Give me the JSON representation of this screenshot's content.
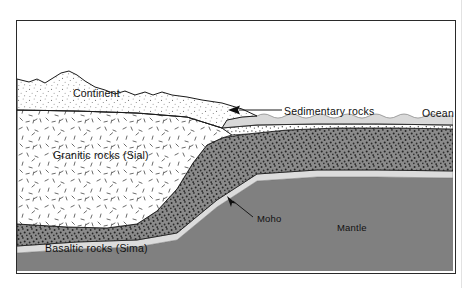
{
  "figure": {
    "kind": "geological-cross-section",
    "frame": {
      "x": 16,
      "y": 20,
      "width": 438,
      "height": 252,
      "border_color": "#2a2a2a"
    }
  },
  "labels": {
    "continent": "Continent",
    "sedimentary_rocks": "Sedimentary rocks",
    "ocean": "Ocean",
    "granitic_rocks": "Granitic rocks (Sial)",
    "basaltic_rocks": "Basaltic rocks (Sima)",
    "moho": "Moho",
    "mantle": "Mantle"
  },
  "layers": [
    {
      "name": "continent-surface",
      "label": "Continent",
      "fill": "#ffffff",
      "pattern": "fine-stipple",
      "description": "hilly land surface with light stippled fill above granitic crust"
    },
    {
      "name": "ocean-water",
      "label": "Ocean",
      "fill": "#d9d9d9",
      "pattern": "none",
      "description": "light grey water body with gently scalloped wavy surface"
    },
    {
      "name": "sedimentary-wedge",
      "label": "Sedimentary rocks",
      "fill": "#ffffff",
      "pattern": "coarse-stipple",
      "description": "thin wedge of sediment thickening seaward over the ocean floor"
    },
    {
      "name": "granitic-crust",
      "label": "Granitic rocks (Sial)",
      "fill": "#ffffff",
      "pattern": "random-dashes",
      "description": "thick continental crust root tapering out beneath the shelf"
    },
    {
      "name": "basaltic-crust",
      "label": "Basaltic rocks (Sima)",
      "fill": "#8b8b8b",
      "pattern": "dense-dots",
      "description": "dark stippled basaltic layer beneath the granite and the ocean"
    },
    {
      "name": "moho-boundary",
      "label": "Moho",
      "fill": "#dcdcdc",
      "pattern": "none",
      "description": "light grey band marking the crust-mantle boundary"
    },
    {
      "name": "mantle",
      "label": "Mantle",
      "fill": "#808080",
      "pattern": "none",
      "description": "solid grey region below the Moho"
    }
  ],
  "annotations": [
    {
      "name": "sedimentary-leader",
      "target": "sedimentary-wedge",
      "arrow": "left",
      "description": "leader line from the Sedimentary rocks label with an arrowhead pointing into the sediment wedge"
    },
    {
      "name": "moho-leader",
      "target": "moho-boundary",
      "arrow": "up-left",
      "description": "leader line from the Moho label with an arrowhead pointing at the light grey band"
    }
  ],
  "colors": {
    "outline": "#1a1a1a",
    "frame": "#2a2a2a",
    "ocean": "#d9d9d9",
    "basalt": "#8b8b8b",
    "basalt_dot": "#2b2b2b",
    "moho": "#dcdcdc",
    "mantle": "#808080",
    "stipple": "#6f6f6f",
    "text": "#111111",
    "background": "#ffffff"
  }
}
